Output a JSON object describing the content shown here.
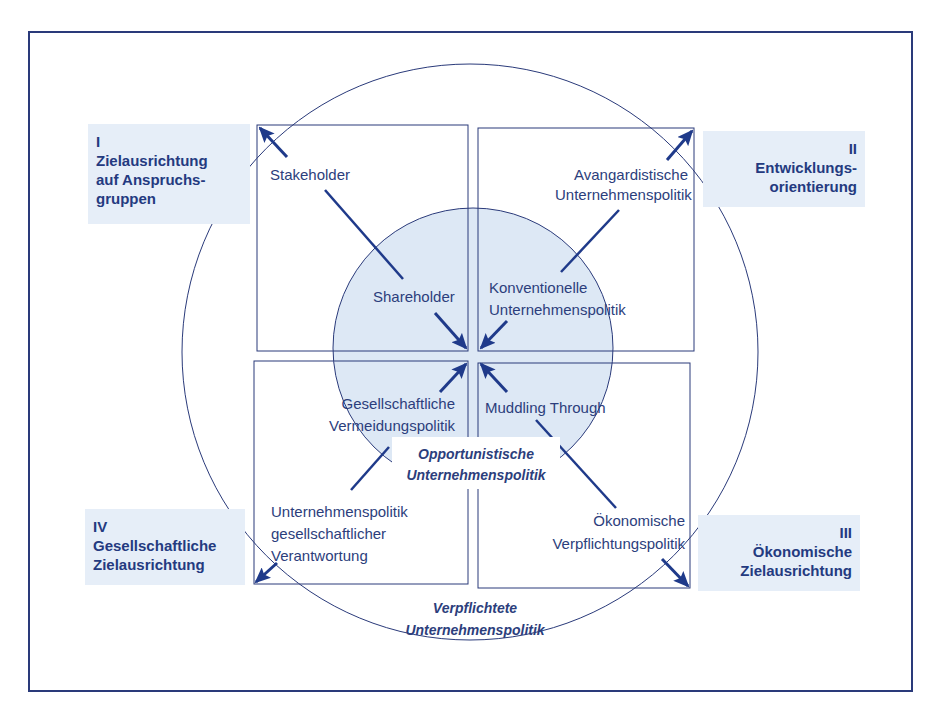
{
  "colors": {
    "line": "#2a3a7a",
    "arrow": "#1f3a8a",
    "label_bg": "#e6eef8",
    "inner_circle_fill": "#dde8f5"
  },
  "quadrant_labels": {
    "q1": {
      "numeral": "I",
      "lines": [
        "Zielausrichtung",
        "auf Anspruchs-",
        "gruppen"
      ]
    },
    "q2": {
      "numeral": "II",
      "lines": [
        "Entwicklungs-",
        "orientierung"
      ]
    },
    "q3": {
      "numeral": "III",
      "lines": [
        "Ökonomische",
        "Zielausrichtung"
      ]
    },
    "q4": {
      "numeral": "IV",
      "lines": [
        "Gesellschaftliche",
        "Zielausrichtung"
      ]
    }
  },
  "outer_policies": {
    "top_left": [
      "Stakeholder"
    ],
    "top_right": [
      "Avangardistische",
      "Unternehmenspolitik"
    ],
    "bottom_left": [
      "Unternehmenspolitik",
      "gesellschaftlicher",
      "Verantwortung"
    ],
    "bottom_right": [
      "Ökonomische",
      "Verpflichtungspolitik"
    ]
  },
  "inner_policies": {
    "top_left": [
      "Shareholder"
    ],
    "top_right": [
      "Konventionelle",
      "Unternehmenspolitik"
    ],
    "bottom_left": [
      "Gesellschaftliche",
      "Vermeidungspolitik"
    ],
    "bottom_right": [
      "Muddling Through"
    ]
  },
  "zone_labels": {
    "inner": [
      "Opportunistische",
      "Unternehmenspolitik"
    ],
    "outer": [
      "Verpflichtete",
      "Unternehmenspolitik"
    ]
  }
}
